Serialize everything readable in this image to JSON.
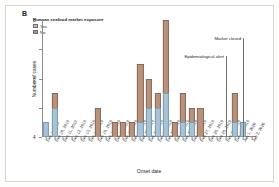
{
  "figure": {
    "panel_label": "B"
  },
  "legend": {
    "title": "Huanan seafood market exposure",
    "items": [
      {
        "label": "Yes",
        "color": "#a8c4d4",
        "icon": "legend-swatch-yes"
      },
      {
        "label": "No",
        "color": "#b8927c",
        "icon": "legend-swatch-no"
      }
    ]
  },
  "annotations": [
    {
      "label": "Epidemiological alert",
      "at": "Dec 30, 2019"
    },
    {
      "label": "Market closed",
      "at": "Jan 1, 2020"
    }
  ],
  "chart_data": {
    "type": "bar",
    "title": "",
    "subtitle": "",
    "xlabel": "Onset date",
    "ylabel": "Number of cases",
    "ylim": [
      0,
      8
    ],
    "yticks": [
      0,
      2,
      4,
      6,
      8
    ],
    "grid": false,
    "legend_position": "top-left",
    "stacked": true,
    "categories": [
      "Dec 1, 2019",
      "Dec 10, 2019",
      "Dec 11, 2019",
      "Dec 12, 2019",
      "Dec 13, 2019",
      "Dec 14, 2019",
      "Dec 15, 2019",
      "Dec 16, 2019",
      "Dec 17, 2019",
      "Dec 18, 2019",
      "Dec 19, 2019",
      "Dec 20, 2019",
      "Dec 21, 2019",
      "Dec 22, 2019",
      "Dec 23, 2019",
      "Dec 24, 2019",
      "Dec 25, 2019",
      "Dec 26, 2019",
      "Dec 27, 2019",
      "Dec 28, 2019",
      "Dec 29, 2019",
      "Dec 30, 2019",
      "Dec 31, 2019",
      "Jan 1, 2020",
      "Jan 2, 2020"
    ],
    "series": [
      {
        "name": "Yes",
        "color": "#a8c4d4",
        "values": [
          1,
          2,
          0,
          0,
          0,
          0,
          0,
          0,
          0,
          0,
          0,
          1,
          2,
          2,
          3,
          0,
          1,
          1,
          0,
          0,
          0,
          0,
          1,
          1,
          0
        ]
      },
      {
        "name": "No",
        "color": "#b8927c",
        "values": [
          0,
          1,
          0,
          0,
          0,
          0,
          2,
          0,
          1,
          1,
          1,
          4,
          2,
          1,
          5,
          1,
          2,
          1,
          2,
          0,
          0,
          0,
          2,
          0,
          0
        ]
      }
    ],
    "totals": [
      1,
      3,
      0,
      0,
      0,
      0,
      2,
      0,
      1,
      1,
      1,
      5,
      4,
      3,
      8,
      1,
      3,
      2,
      2,
      0,
      0,
      0,
      3,
      1,
      0
    ]
  }
}
